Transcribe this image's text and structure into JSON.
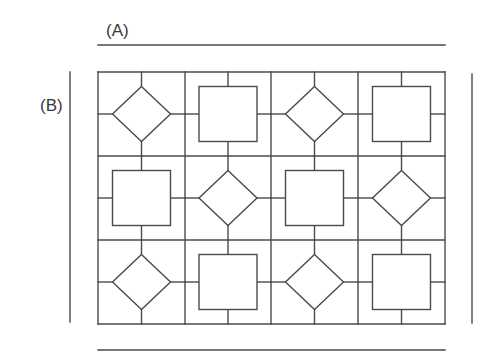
{
  "labels": {
    "a": "(A)",
    "b": "(B)"
  },
  "colors": {
    "stroke": "#4a4a4a",
    "background": "#ffffff"
  },
  "grid": {
    "rows": 3,
    "cols": 4,
    "x_bounds": [
      98,
      185,
      271,
      358,
      445
    ],
    "y_bounds": [
      72,
      156,
      240,
      324
    ],
    "pattern": [
      [
        "diamond",
        "square",
        "diamond",
        "square"
      ],
      [
        "square",
        "diamond",
        "square",
        "diamond"
      ],
      [
        "diamond",
        "square",
        "diamond",
        "square"
      ]
    ]
  },
  "dimension_lines": {
    "top": {
      "x1": 98,
      "x2": 445,
      "y": 45
    },
    "bottom": {
      "x1": 98,
      "x2": 445,
      "y": 350
    },
    "left": {
      "x": 70,
      "y1": 72,
      "y2": 322
    },
    "right": {
      "x": 472,
      "y1": 74,
      "y2": 323
    }
  }
}
